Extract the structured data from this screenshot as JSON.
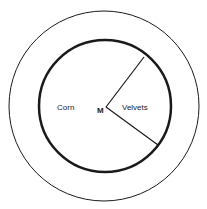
{
  "diagram": {
    "type": "concentric-circle-sector-diagram",
    "labels": {
      "left_region": "Corn",
      "right_sector": "Velvets",
      "center_point": "M"
    },
    "colors": {
      "stroke": "#1a1a1a",
      "background": "#ffffff"
    },
    "geometry": {
      "outer_circle": {
        "cx": 104,
        "cy": 106,
        "r": 95,
        "stroke_width": 1
      },
      "inner_circle": {
        "cx": 105,
        "cy": 106,
        "r": 66,
        "stroke_width": 2.5
      },
      "vertex": {
        "x": 106,
        "y": 107
      },
      "ray_upper_end": {
        "x": 144,
        "y": 57
      },
      "ray_lower_end": {
        "x": 158,
        "y": 145
      }
    }
  }
}
